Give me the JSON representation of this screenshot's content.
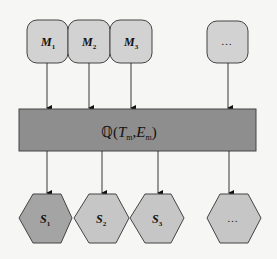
{
  "diagram": {
    "inputs": [
      {
        "label": "M",
        "subscript": "1"
      },
      {
        "label": "M",
        "subscript": "2"
      },
      {
        "label": "M",
        "subscript": "3"
      },
      {
        "label": "…",
        "subscript": ""
      }
    ],
    "process": {
      "symbol": "ℚ",
      "open": "(",
      "arg1": "T",
      "arg1_sub": "m",
      "sep": ",",
      "arg2": "E",
      "arg2_sub": "m",
      "close": ")"
    },
    "outputs": [
      {
        "label": "S",
        "subscript": "1"
      },
      {
        "label": "S",
        "subscript": "2"
      },
      {
        "label": "S",
        "subscript": "3"
      },
      {
        "label": "…",
        "subscript": ""
      }
    ],
    "colors": {
      "input_fill": "#d2d2d2",
      "process_fill": "#8e8e8e",
      "output_first_fill": "#a4a4a4",
      "output_fill": "#c6c6c6",
      "stroke": "#333333"
    }
  }
}
